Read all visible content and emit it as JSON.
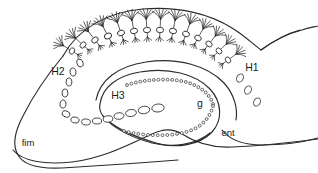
{
  "figure": {
    "caption": "",
    "width": 318,
    "height": 173,
    "background_color": "#ffffff",
    "ink_color": "#2b2b2b"
  },
  "labels": [
    {
      "id": "H1",
      "text": "H1",
      "x": 252,
      "y": 68,
      "size": "normal"
    },
    {
      "id": "H2",
      "text": "H2",
      "x": 58,
      "y": 72,
      "size": "normal"
    },
    {
      "id": "H3",
      "text": "H3",
      "x": 118,
      "y": 96,
      "size": "normal"
    },
    {
      "id": "g",
      "text": "g",
      "x": 200,
      "y": 104,
      "size": "normal"
    },
    {
      "id": "ent",
      "text": "ent",
      "x": 228,
      "y": 133,
      "size": "small"
    },
    {
      "id": "fim",
      "text": "fim",
      "x": 28,
      "y": 143,
      "size": "small"
    }
  ],
  "outlines": [
    {
      "name": "hippocampus-outer-boundary",
      "d": "M 63 56 C 78 28 108 12 143 9 C 178 6 210 14 232 28 C 245 36 253 44 261 50 C 272 42 285 34 300 30"
    },
    {
      "name": "hippocampus-upper-right-notch",
      "d": "M 261 50 C 272 42 286 34 302 30 C 308 28 314 27 318 26"
    },
    {
      "name": "hippocampus-left-fimbria-boundary",
      "d": "M 63 56 C 48 74 33 96 23 116 C 15 131 12 145 18 155 C 24 166 40 169 62 168 C 95 166 140 163 178 160"
    },
    {
      "name": "hippocampus-lower-boundary",
      "d": "M 13 150 C 22 161 44 165 72 162 C 104 158 130 144 152 134 C 163 129 172 128 182 134 C 196 143 212 148 232 147 C 258 146 288 143 318 139"
    },
    {
      "name": "dentate-hilus-outline",
      "d": "M 100 104 C 102 88 116 76 140 72 C 168 67 196 74 210 89 C 222 102 223 120 212 132 C 200 145 176 149 156 143 C 132 136 112 126 103 116 C 100 112 99 108 100 104"
    },
    {
      "name": "dentate-hilus-lower-arc",
      "d": "M 103 116 C 112 127 130 137 152 143 C 172 148 196 145 210 133"
    },
    {
      "name": "inner-cornu-ammonis-arc",
      "d": "M 96 100 C 100 80 118 66 146 62 C 178 57 208 66 224 83 C 234 94 238 108 236 120"
    },
    {
      "name": "entorhinal-boundary",
      "d": "M 222 130 C 230 140 244 145 262 145 C 284 145 304 142 318 138"
    }
  ],
  "pyramidal_neurons": [
    {
      "x": 72,
      "y": 51,
      "angle": -58,
      "scale": 0.92,
      "apical": 6,
      "basal": 4
    },
    {
      "x": 83,
      "y": 45,
      "angle": -48,
      "scale": 0.95,
      "apical": 6,
      "basal": 4
    },
    {
      "x": 95,
      "y": 40,
      "angle": -38,
      "scale": 0.98,
      "apical": 6,
      "basal": 4
    },
    {
      "x": 108,
      "y": 36,
      "angle": -28,
      "scale": 1.0,
      "apical": 6,
      "basal": 4
    },
    {
      "x": 121,
      "y": 33,
      "angle": -19,
      "scale": 1.0,
      "apical": 6,
      "basal": 4
    },
    {
      "x": 134,
      "y": 31,
      "angle": -11,
      "scale": 1.0,
      "apical": 6,
      "basal": 4
    },
    {
      "x": 147,
      "y": 30,
      "angle": -4,
      "scale": 1.0,
      "apical": 6,
      "basal": 4
    },
    {
      "x": 160,
      "y": 30,
      "angle": 3,
      "scale": 1.0,
      "apical": 6,
      "basal": 4
    },
    {
      "x": 173,
      "y": 31,
      "angle": 11,
      "scale": 1.0,
      "apical": 6,
      "basal": 4
    },
    {
      "x": 186,
      "y": 34,
      "angle": 20,
      "scale": 0.98,
      "apical": 6,
      "basal": 4
    },
    {
      "x": 198,
      "y": 38,
      "angle": 29,
      "scale": 0.96,
      "apical": 6,
      "basal": 4
    },
    {
      "x": 209,
      "y": 44,
      "angle": 38,
      "scale": 0.94,
      "apical": 6,
      "basal": 4
    },
    {
      "x": 219,
      "y": 51,
      "angle": 46,
      "scale": 0.92,
      "apical": 6,
      "basal": 4
    },
    {
      "x": 228,
      "y": 60,
      "angle": 54,
      "scale": 0.9,
      "apical": 6,
      "basal": 4
    }
  ],
  "interneuron_chains": [
    {
      "name": "H2-chain",
      "ovals": [
        {
          "x": 80,
          "y": 63,
          "rx": 3.0,
          "ry": 4.0,
          "angle": -20
        },
        {
          "x": 73,
          "y": 72,
          "rx": 3.0,
          "ry": 4.0,
          "angle": -12
        },
        {
          "x": 69,
          "y": 82,
          "rx": 2.9,
          "ry": 4.0,
          "angle": -6
        },
        {
          "x": 65,
          "y": 93,
          "rx": 2.9,
          "ry": 4.0,
          "angle": 4
        },
        {
          "x": 63,
          "y": 104,
          "rx": 3.0,
          "ry": 4.0,
          "angle": 12
        },
        {
          "x": 66,
          "y": 114,
          "rx": 4.0,
          "ry": 3.0,
          "angle": 20
        },
        {
          "x": 75,
          "y": 120,
          "rx": 4.2,
          "ry": 3.0,
          "angle": 12
        },
        {
          "x": 86,
          "y": 122,
          "rx": 4.4,
          "ry": 3.0,
          "angle": 5
        }
      ]
    },
    {
      "name": "H3-chain",
      "ovals": [
        {
          "x": 97,
          "y": 121,
          "rx": 4.6,
          "ry": 3.0,
          "angle": 0
        },
        {
          "x": 108,
          "y": 119,
          "rx": 4.8,
          "ry": 3.2,
          "angle": -4
        },
        {
          "x": 119,
          "y": 116,
          "rx": 5.0,
          "ry": 3.3,
          "angle": -6
        },
        {
          "x": 131,
          "y": 113,
          "rx": 5.4,
          "ry": 3.5,
          "angle": -8
        },
        {
          "x": 144,
          "y": 110,
          "rx": 5.8,
          "ry": 3.7,
          "angle": -8
        },
        {
          "x": 158,
          "y": 108,
          "rx": 6.2,
          "ry": 4.0,
          "angle": -6
        }
      ]
    },
    {
      "name": "H1-chain",
      "ovals": [
        {
          "x": 240,
          "y": 78,
          "rx": 3.2,
          "ry": 4.3,
          "angle": 25
        },
        {
          "x": 248,
          "y": 90,
          "rx": 3.2,
          "ry": 4.3,
          "angle": 25
        },
        {
          "x": 257,
          "y": 102,
          "rx": 3.2,
          "ry": 4.3,
          "angle": 25
        }
      ]
    }
  ],
  "granule_bands": [
    {
      "name": "dentate-granule-upper-limb",
      "d": "M 127 85 C 145 79 170 78 186 82 C 200 86 210 94 213 104",
      "count": 22,
      "radius": 1.45
    },
    {
      "name": "dentate-granule-lower-limb",
      "d": "M 124 131 C 143 136 168 137 186 132 C 201 128 210 118 213 106",
      "count": 22,
      "radius": 1.45
    }
  ]
}
